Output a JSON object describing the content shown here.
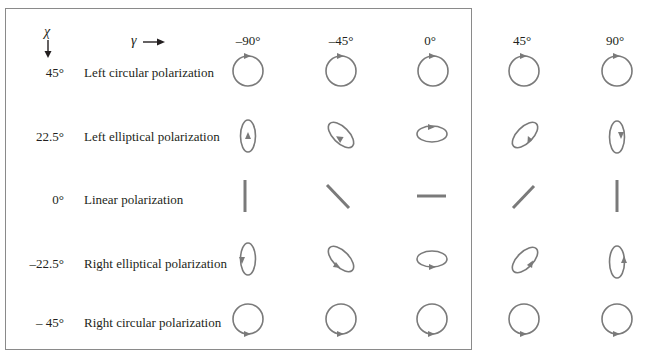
{
  "diagram": {
    "axis_chi_label": "χ",
    "axis_gamma_label": "γ",
    "columns": [
      {
        "gamma": "–90°",
        "angle": -90
      },
      {
        "gamma": "–45°",
        "angle": -45
      },
      {
        "gamma": "0°",
        "angle": 0
      },
      {
        "gamma": "45°",
        "angle": 45
      },
      {
        "gamma": "90°",
        "angle": 90
      }
    ],
    "rows": [
      {
        "chi": "45°",
        "label": "Left circular polarization",
        "type": "circle",
        "handedness": "left"
      },
      {
        "chi": "22.5°",
        "label": "Left elliptical polarization",
        "type": "ellipse",
        "handedness": "left"
      },
      {
        "chi": "0°",
        "label": "Linear polarization",
        "type": "line",
        "handedness": "none"
      },
      {
        "chi": "–22.5°",
        "label": "Right elliptical polarization",
        "type": "ellipse",
        "handedness": "right"
      },
      {
        "chi": "– 45°",
        "label": "Right circular polarization",
        "type": "circle",
        "handedness": "right"
      }
    ],
    "colors": {
      "stroke": "#7a7a7a",
      "text": "#231f20",
      "border": "#8a8a8a"
    }
  }
}
